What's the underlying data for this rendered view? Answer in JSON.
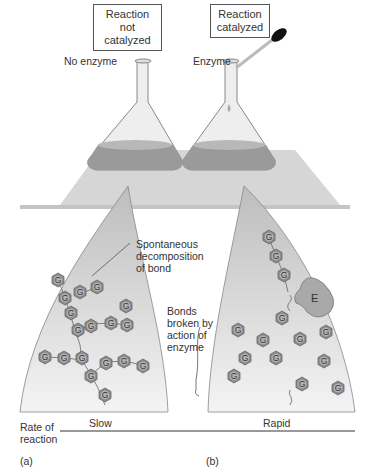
{
  "panels": {
    "a": {
      "box_label": "Reaction not catalyzed",
      "box_line1": "Reaction not",
      "box_line2": "catalyzed",
      "flask_label": "No enzyme",
      "callout_line1": "Spontaneous",
      "callout_line2": "decomposition",
      "callout_line3": "of bond",
      "rate": "Slow",
      "panel_tag": "(a)"
    },
    "b": {
      "box_label": "Reaction catalyzed",
      "box_line1": "Reaction",
      "box_line2": "catalyzed",
      "flask_label": "Enzyme",
      "callout_line1": "Bonds",
      "callout_line2": "broken by",
      "callout_line3": "action of",
      "callout_line4": "enzyme",
      "enzyme_symbol": "E",
      "rate": "Rapid",
      "panel_tag": "(b)"
    }
  },
  "axis": {
    "label_line1": "Rate of",
    "label_line2": "reaction"
  },
  "molecule_symbol": "G",
  "colors": {
    "liquid": "#9a9a9a",
    "shelf": "#d8d8d8",
    "molecule": "#8c8c8c",
    "enzyme": "#a9a9a9"
  }
}
